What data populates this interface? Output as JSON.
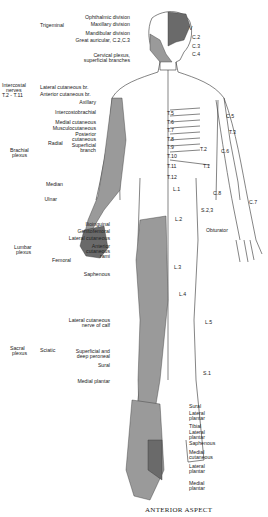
{
  "caption": "ANTERIOR ASPECT",
  "colors": {
    "shade_dark": "#6a6a6a",
    "shade_mid": "#9a9a9a",
    "shade_light": "#c4c4c4",
    "line": "#333333"
  },
  "left_labels": {
    "trigeminal": {
      "group": "Trigeminal",
      "items": [
        "Ophthalmic division",
        "Maxillary division",
        "Mandibular division"
      ]
    },
    "great_auricular": "Great auricular, C.2,C.3",
    "cervical_plexus": [
      "Cervical plexus,",
      "superficial branches"
    ],
    "intercostal": {
      "group": [
        "Intercostal",
        "nerves",
        "T.2 - T.11"
      ],
      "items": [
        "Lateral cutaneous br.",
        "Anterior cutaneous br."
      ]
    },
    "brachial": {
      "group": [
        "Brachial",
        "plexus"
      ],
      "items": [
        "Axillary",
        "Intercostobrachial",
        "Medial cutaneous",
        "Musculocutaneous"
      ],
      "radial": {
        "group": "Radial",
        "items": [
          [
            "Posterior",
            "cutaneous"
          ],
          [
            "Superficial",
            "branch"
          ]
        ]
      },
      "more": [
        "Median",
        "Ulnar"
      ]
    },
    "lumbar": {
      "group": [
        "Lumbar",
        "plexus"
      ],
      "items": [
        "Ilioinguinal",
        "Genitofemoral",
        "Lateral cutaneous"
      ],
      "femoral": {
        "group": "Femoral",
        "items": [
          [
            "Anterior",
            "cutaneous",
            "rami"
          ],
          [
            "Saphenous"
          ]
        ]
      }
    },
    "sacral": {
      "group": [
        "Sacral",
        "plexus"
      ],
      "sciatic": {
        "group": "Sciatic",
        "items": [
          [
            "Lateral cutaneous",
            "nerve of calf"
          ],
          [
            "Superficial and",
            "deep peroneal"
          ],
          [
            "Sural"
          ]
        ]
      },
      "more": [
        "Medial plantar"
      ]
    }
  },
  "right_labels": {
    "dermatomes": [
      "V",
      "C.2",
      "C.3",
      "C.4",
      "C.5",
      "T.3",
      "T.2",
      "C.6",
      "T.1",
      "C.8",
      "C.7",
      "S.2,3",
      "Obturator",
      "L.5",
      "S.1"
    ],
    "trunk": [
      "T.5",
      "T.6",
      "T.7",
      "T.8",
      "T.9",
      "T.10",
      "T.11",
      "T.12",
      "L.1",
      "L.2",
      "L.3",
      "L.4"
    ]
  },
  "foot_labels": [
    "Sural",
    [
      "Lateral",
      "plantar"
    ],
    "Tibial",
    [
      "Lateral",
      "plantar"
    ],
    "Saphenous",
    [
      "Medial",
      "cutaneous"
    ],
    [
      "Lateral",
      "plantar"
    ],
    [
      "Medial",
      "plantar"
    ]
  ]
}
